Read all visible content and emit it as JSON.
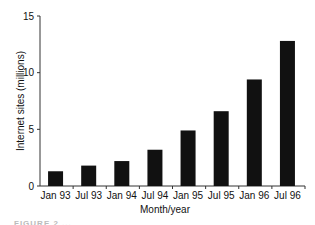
{
  "chart_data": {
    "type": "bar",
    "title": "",
    "xlabel": "Month/year",
    "ylabel": "Internet sites (millions)",
    "categories": [
      "Jan 93",
      "Jul 93",
      "Jan 94",
      "Jul 94",
      "Jan 95",
      "Jul 95",
      "Jan 96",
      "Jul 96"
    ],
    "values": [
      1.3,
      1.8,
      2.2,
      3.2,
      4.9,
      6.6,
      9.4,
      12.8
    ],
    "ylim": [
      0,
      15
    ],
    "yticks": [
      0,
      5,
      10,
      15
    ],
    "grid": false,
    "legend": null,
    "bar_color": "#111111"
  },
  "caption": "FIGURE 2 ..."
}
